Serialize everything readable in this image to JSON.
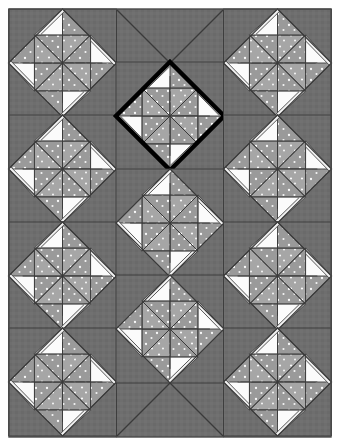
{
  "artwork": {
    "title": "Three-Panel Pinwheel Star Quilt",
    "medium": "patchwork quilt photograph",
    "panel_count": 3,
    "block_pattern_name": "pinwheel-star-on-point"
  },
  "canvas": {
    "width": 340,
    "height": 446,
    "background": "#ffffff",
    "margin_left": 9,
    "margin_top": 9,
    "margin_right": 9,
    "margin_bottom": 9
  },
  "colors": {
    "background_white": "#ffffff",
    "sashing_gray": "#6e6e6e",
    "setting_gray": "#6f6f6f",
    "fabric_medium_gray": "#9a9a9a",
    "fabric_light": "#f2f2f2",
    "fabric_white": "#fbfbfb",
    "seam_line": "#3a3a3a",
    "outline_black": "#111111",
    "highlight_outline": "#000000",
    "dot_print": "#ffffff",
    "frame_border": "#555555"
  },
  "frame": {
    "x": 9,
    "y": 9,
    "width": 322,
    "height": 428,
    "stroke": "#4a4a4a",
    "stroke_width": 1.4
  },
  "panels": [
    {
      "name": "left-panel",
      "label": "Left Panel",
      "x": 9,
      "y": 9,
      "width": 107,
      "height": 428,
      "block_count": 4
    },
    {
      "name": "center-panel",
      "label": "Center Panel",
      "x": 116,
      "y": 9,
      "width": 108,
      "height": 428,
      "block_count": 3
    },
    {
      "name": "right-panel",
      "label": "Right Panel",
      "x": 224,
      "y": 9,
      "width": 107,
      "height": 428,
      "block_count": 4
    }
  ],
  "blocks": [
    {
      "id": "L1",
      "panel": "left-panel",
      "cx": 62.5,
      "cy": 63,
      "half": 54,
      "highlighted": false,
      "spin": "cw"
    },
    {
      "id": "L2",
      "panel": "left-panel",
      "cx": 62.5,
      "cy": 169,
      "half": 54,
      "highlighted": false,
      "spin": "cw"
    },
    {
      "id": "L3",
      "panel": "left-panel",
      "cx": 62.5,
      "cy": 276,
      "half": 54,
      "highlighted": false,
      "spin": "cw"
    },
    {
      "id": "L4",
      "panel": "left-panel",
      "cx": 62.5,
      "cy": 382,
      "half": 54,
      "highlighted": false,
      "spin": "cw"
    },
    {
      "id": "C1",
      "panel": "center-panel",
      "cx": 170,
      "cy": 116,
      "half": 54,
      "highlighted": true,
      "spin": "cw"
    },
    {
      "id": "C2",
      "panel": "center-panel",
      "cx": 170,
      "cy": 223,
      "half": 54,
      "highlighted": false,
      "spin": "cw"
    },
    {
      "id": "C3",
      "panel": "center-panel",
      "cx": 170,
      "cy": 329,
      "half": 54,
      "highlighted": false,
      "spin": "cw"
    },
    {
      "id": "R1",
      "panel": "right-panel",
      "cx": 277.5,
      "cy": 63,
      "half": 54,
      "highlighted": false,
      "spin": "cw"
    },
    {
      "id": "R2",
      "panel": "right-panel",
      "cx": 277.5,
      "cy": 169,
      "half": 54,
      "highlighted": false,
      "spin": "cw"
    },
    {
      "id": "R3",
      "panel": "right-panel",
      "cx": 277.5,
      "cy": 276,
      "half": 54,
      "highlighted": false,
      "spin": "cw"
    },
    {
      "id": "R4",
      "panel": "right-panel",
      "cx": 277.5,
      "cy": 382,
      "half": 54,
      "highlighted": false,
      "spin": "cw"
    }
  ],
  "setting_seams": [
    {
      "name": "center-top-left-diagonal",
      "x1": 116,
      "y1": 9,
      "x2": 170,
      "y2": 63
    },
    {
      "name": "center-top-right-diagonal",
      "x1": 224,
      "y1": 9,
      "x2": 170,
      "y2": 63
    },
    {
      "name": "center-bottom-left-diagonal",
      "x1": 116,
      "y1": 437,
      "x2": 170,
      "y2": 383
    },
    {
      "name": "center-bottom-right-diagonal",
      "x1": 224,
      "y1": 437,
      "x2": 170,
      "y2": 383
    },
    {
      "name": "sashing-seam-left",
      "x1": 116,
      "y1": 9,
      "x2": 116,
      "y2": 437
    },
    {
      "name": "sashing-seam-right",
      "x1": 224,
      "y1": 9,
      "x2": 224,
      "y2": 437
    }
  ],
  "highlight": {
    "block_id": "C1",
    "note": "thick black diamond outline",
    "stroke_width": 4.5
  },
  "dot_print": {
    "description": "white polka dots on the medium gray fabric triangles",
    "dot_radius": 1.1,
    "dots_per_triangle": 3
  }
}
